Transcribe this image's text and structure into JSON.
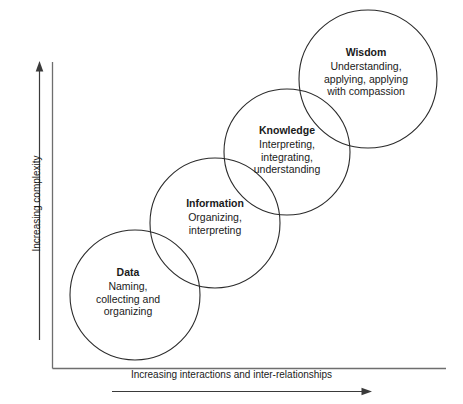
{
  "diagram": {
    "type": "venn-chain",
    "title": "",
    "background_color": "#ffffff",
    "stroke_color": "#2b2b2b",
    "text_color": "#1a1a1a",
    "axes": {
      "x_label": "Increasing interactions and inter-relationships",
      "y_label": "Increasing complexity",
      "x_arrow_direction": "right",
      "y_arrow_direction": "up"
    },
    "nodes": [
      {
        "id": "data",
        "title": "Data",
        "desc_lines": [
          "Naming,",
          "collecting and",
          "organizing"
        ],
        "cx": 135,
        "cy": 295,
        "r": 65
      },
      {
        "id": "information",
        "title": "Information",
        "desc_lines": [
          "Organizing,",
          "interpreting"
        ],
        "cx": 215,
        "cy": 223,
        "r": 65
      },
      {
        "id": "knowledge",
        "title": "Knowledge",
        "desc_lines": [
          "Interpreting,",
          "integrating,",
          "understanding"
        ],
        "cx": 287,
        "cy": 152,
        "r": 63
      },
      {
        "id": "wisdom",
        "title": "Wisdom",
        "desc_lines": [
          "Understanding,",
          "applying, applying",
          "with compassion"
        ],
        "cx": 368,
        "cy": 79,
        "r": 69
      }
    ]
  }
}
